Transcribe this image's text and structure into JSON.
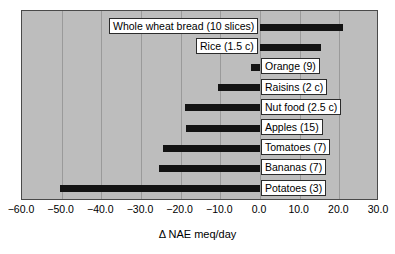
{
  "chart_data": {
    "type": "bar",
    "orientation": "horizontal",
    "title": "",
    "xlabel": "Δ NAE meq/day",
    "ylabel": "",
    "xlim": [
      -60.0,
      30.0
    ],
    "xticks": [
      "−60.0",
      "−50.0",
      "−40.0",
      "−30.0",
      "−20.0",
      "−10.0",
      "0.0",
      "10.0",
      "20.0",
      "30.0"
    ],
    "xtick_values": [
      -60,
      -50,
      -40,
      -30,
      -20,
      -10,
      0,
      10,
      20,
      30
    ],
    "grid": "vertical",
    "legend": "none",
    "bar_color": "#131313",
    "plot_background": "#bdbdbd",
    "categories": [
      "Whole wheat bread (10 slices)",
      "Rice (1.5 c)",
      "Orange (9)",
      "Raisins (2 c)",
      "Nut food (2.5 c)",
      "Apples (15)",
      "Tomatoes (7)",
      "Bananas (7)",
      "Potatoes (3)"
    ],
    "values": [
      21.0,
      15.5,
      -2.3,
      -10.7,
      -19.0,
      -18.6,
      -24.5,
      -25.5,
      -50.5
    ],
    "label_side": [
      "left",
      "left",
      "right",
      "right",
      "right",
      "right",
      "right",
      "right",
      "right"
    ]
  },
  "axis": {
    "xlabel": "Δ NAE meq/day"
  }
}
